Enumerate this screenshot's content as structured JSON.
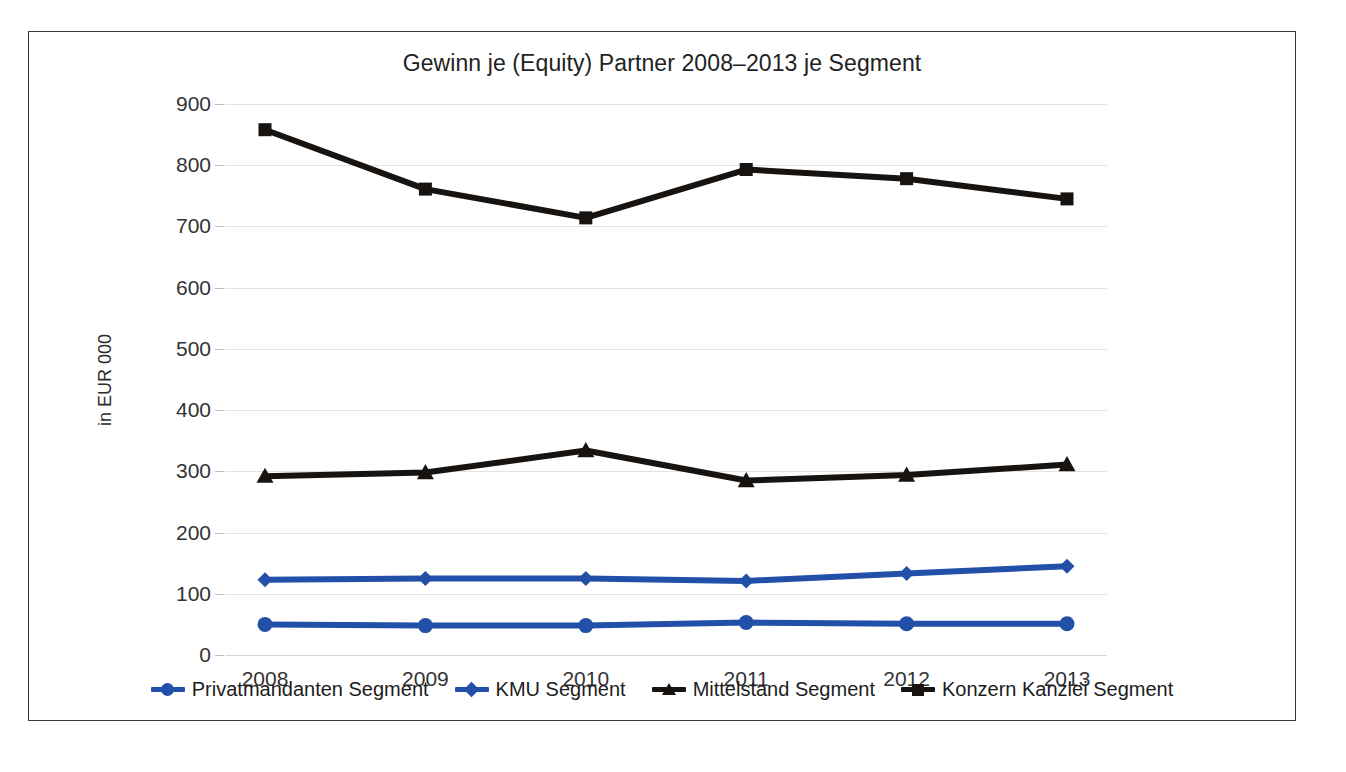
{
  "figure": {
    "title": "Gewinn je (Equity) Partner 2008–2013 je Segment",
    "y_axis_title": "in EUR 000",
    "caption": ""
  },
  "chart_data": {
    "type": "line",
    "title": "Gewinn je (Equity) Partner 2008–2013 je Segment",
    "xlabel": "",
    "ylabel": "in EUR 000",
    "categories": [
      "2008",
      "2009",
      "2010",
      "2011",
      "2012",
      "2013"
    ],
    "ylim": [
      0,
      900
    ],
    "yticks": [
      0,
      100,
      200,
      300,
      400,
      500,
      600,
      700,
      800,
      900
    ],
    "ytick_labels": [
      "0",
      "100",
      "200",
      "300",
      "400",
      "500",
      "600",
      "700",
      "800",
      "900"
    ],
    "grid": true,
    "legend_position": "bottom",
    "series": [
      {
        "name": "Privatmandanten Segment",
        "color": "#2250A8",
        "marker": "circle",
        "values": [
          50,
          48,
          48,
          53,
          51,
          51
        ]
      },
      {
        "name": "KMU Segment",
        "color": "#2250A8",
        "marker": "diamond",
        "values": [
          123,
          125,
          125,
          121,
          133,
          145
        ]
      },
      {
        "name": "Mittelstand Segment",
        "color": "#171310",
        "marker": "triangle",
        "values": [
          292,
          298,
          334,
          285,
          294,
          311
        ]
      },
      {
        "name": "Konzern Kanzlei Segment",
        "color": "#171310",
        "marker": "square",
        "values": [
          858,
          761,
          714,
          793,
          778,
          745
        ]
      }
    ]
  },
  "legend": {
    "items": [
      {
        "label": "Privatmandanten Segment",
        "color": "#2250A8",
        "marker": "circle"
      },
      {
        "label": "KMU Segment",
        "color": "#2250A8",
        "marker": "diamond"
      },
      {
        "label": "Mittelstand Segment",
        "color": "#171310",
        "marker": "triangle"
      },
      {
        "label": "Konzern Kanzlei Segment",
        "color": "#171310",
        "marker": "square"
      }
    ]
  }
}
